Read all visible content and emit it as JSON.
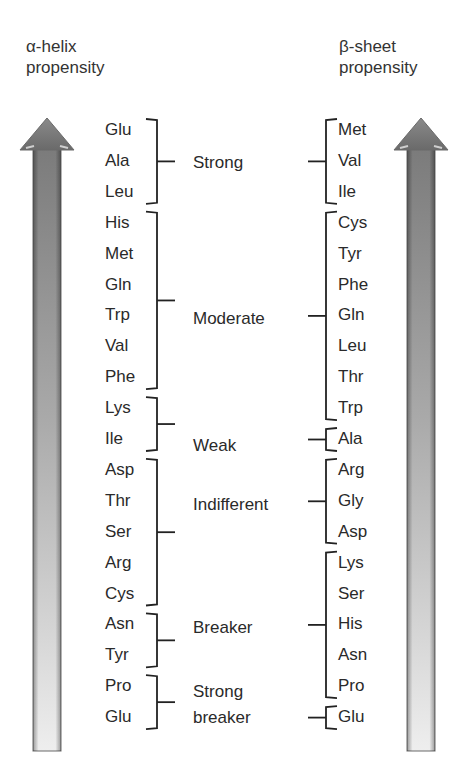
{
  "headers": {
    "left": {
      "line1": "α-helix",
      "line2": "propensity"
    },
    "right": {
      "line1": "β-sheet",
      "line2": "propensity"
    }
  },
  "categories": [
    {
      "label": "Strong"
    },
    {
      "label": "Moderate"
    },
    {
      "label": "Weak"
    },
    {
      "label": "Indifferent"
    },
    {
      "label": "Breaker"
    },
    {
      "label": "Strong",
      "label2": "breaker"
    }
  ],
  "alpha_helix": {
    "residues": [
      "Glu",
      "Ala",
      "Leu",
      "His",
      "Met",
      "Gln",
      "Trp",
      "Val",
      "Phe",
      "Lys",
      "Ile",
      "Asp",
      "Thr",
      "Ser",
      "Arg",
      "Cys",
      "Asn",
      "Tyr",
      "Pro",
      "Glu"
    ],
    "groups": [
      {
        "category": "Strong",
        "start": 0,
        "end": 2
      },
      {
        "category": "Moderate",
        "start": 3,
        "end": 8
      },
      {
        "category": "Weak",
        "start": 9,
        "end": 10
      },
      {
        "category": "Indifferent",
        "start": 11,
        "end": 15
      },
      {
        "category": "Breaker",
        "start": 16,
        "end": 17
      },
      {
        "category": "Strong breaker",
        "start": 18,
        "end": 19
      }
    ]
  },
  "beta_sheet": {
    "residues": [
      "Met",
      "Val",
      "Ile",
      "Cys",
      "Tyr",
      "Phe",
      "Gln",
      "Leu",
      "Thr",
      "Trp",
      "Ala",
      "Arg",
      "Gly",
      "Asp",
      "Lys",
      "Ser",
      "His",
      "Asn",
      "Pro",
      "Glu"
    ],
    "groups": [
      {
        "category": "Strong",
        "start": 0,
        "end": 2
      },
      {
        "category": "Moderate",
        "start": 3,
        "end": 9
      },
      {
        "category": "Weak",
        "start": 10,
        "end": 10
      },
      {
        "category": "Indifferent",
        "start": 11,
        "end": 13
      },
      {
        "category": "Breaker",
        "start": 14,
        "end": 18
      },
      {
        "category": "Strong breaker",
        "start": 19,
        "end": 19
      }
    ]
  },
  "colors": {
    "arrow_dark": "#6e6e6e",
    "arrow_light": "#ececec",
    "text": "#2a2a2a",
    "bracket": "#222222"
  }
}
